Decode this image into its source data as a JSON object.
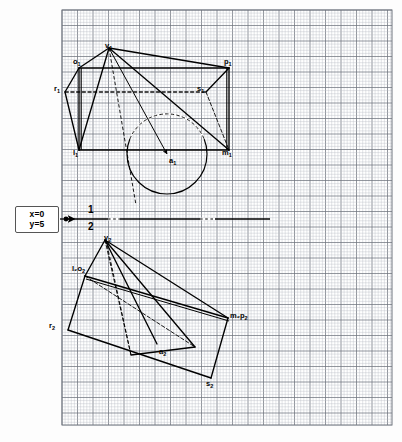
{
  "sheet": {
    "background_color": "#fdfdfd",
    "grid": {
      "x": 62,
      "y": 10,
      "width": 330,
      "height": 415,
      "minor_step": 3.1,
      "major_every": 5,
      "minor_color": "#b9bcc4",
      "major_color": "#6f747e",
      "border_color": "#6f747e"
    }
  },
  "callout": {
    "name": "coordinate-callout",
    "line1": "x=0",
    "line2": "y=5",
    "arrow_from_x": 60,
    "arrow_to_x": 74,
    "arrow_y": 219
  },
  "fold_line": {
    "label_top": "1",
    "label_bottom": "2",
    "y": 219,
    "x_start": 64,
    "x_end": 270,
    "origin_dot_x": 66,
    "label_x": 88
  },
  "labels": [
    {
      "name": "label-v1",
      "text": "v",
      "sub": "1",
      "x": 105,
      "y": 42
    },
    {
      "name": "label-o1",
      "text": "o",
      "sub": "1",
      "x": 73,
      "y": 58
    },
    {
      "name": "label-p1",
      "text": "p",
      "sub": "1",
      "x": 224,
      "y": 58
    },
    {
      "name": "label-r1",
      "text": "r",
      "sub": "1",
      "x": 54,
      "y": 85
    },
    {
      "name": "label-s1",
      "text": "s",
      "sub": "1",
      "x": 197,
      "y": 85
    },
    {
      "name": "label-l1",
      "text": "l",
      "sub": "1",
      "x": 73,
      "y": 149
    },
    {
      "name": "label-m1",
      "text": "m",
      "sub": "1",
      "x": 222,
      "y": 149
    },
    {
      "name": "label-a1",
      "text": "a",
      "sub": "1",
      "x": 169,
      "y": 157
    },
    {
      "name": "label-v2",
      "text": "v",
      "sub": "2",
      "x": 104,
      "y": 234
    },
    {
      "name": "label-l2o2",
      "text": "l₂o",
      "sub": "2",
      "x": 72,
      "y": 265
    },
    {
      "name": "label-r2",
      "text": "r",
      "sub": "2",
      "x": 49,
      "y": 322
    },
    {
      "name": "label-m2p2",
      "text": "m₂p",
      "sub": "2",
      "x": 230,
      "y": 312
    },
    {
      "name": "label-a2",
      "text": "a",
      "sub": "2",
      "x": 159,
      "y": 348
    },
    {
      "name": "label-s2",
      "text": "s",
      "sub": "2",
      "x": 206,
      "y": 380
    }
  ],
  "geometry": {
    "stroke_color": "#000000",
    "top_view": {
      "name": "top-view-cone-and-prism",
      "points": {
        "v1": [
          109,
          48
        ],
        "o1": [
          79,
          68
        ],
        "p1": [
          229,
          68
        ],
        "l1": [
          79,
          150
        ],
        "m1": [
          229,
          150
        ],
        "r1": [
          65,
          92
        ],
        "s1": [
          206,
          92
        ],
        "a1": [
          167,
          154
        ]
      },
      "circle": {
        "cx": 167,
        "cy": 154,
        "r": 40
      },
      "solid_edges": [
        [
          "o1",
          "p1"
        ],
        [
          "l1",
          "m1"
        ],
        [
          "o1",
          "l1"
        ],
        [
          "p1",
          "m1"
        ],
        [
          "o1",
          "r1"
        ],
        [
          "r1",
          "l1"
        ],
        [
          "p1",
          "s1"
        ],
        [
          "v1",
          "o1"
        ],
        [
          "v1",
          "p1"
        ],
        [
          "v1",
          "m1"
        ],
        [
          "v1",
          "l1"
        ]
      ],
      "hidden_edges": [
        [
          "s1",
          "m1"
        ],
        [
          "r1",
          "s1"
        ]
      ],
      "arrow_line": [
        "v1",
        "a1"
      ]
    },
    "front_view": {
      "name": "front-view-cone-and-prism",
      "points": {
        "v2": [
          105,
          240
        ],
        "l2o2": [
          85,
          276
        ],
        "m2p2": [
          228,
          318
        ],
        "s2": [
          211,
          378
        ],
        "r2": [
          68,
          330
        ],
        "a2": [
          157,
          344
        ],
        "b2": [
          131,
          355
        ],
        "c2": [
          195,
          347
        ]
      },
      "solid_edges": [
        [
          "l2o2",
          "m2p2"
        ],
        [
          "m2p2",
          "s2"
        ],
        [
          "s2",
          "r2"
        ],
        [
          "r2",
          "l2o2"
        ],
        [
          "v2",
          "l2o2"
        ],
        [
          "v2",
          "m2p2"
        ],
        [
          "v2",
          "c2"
        ],
        [
          "v2",
          "a2"
        ],
        [
          "b2",
          "c2"
        ]
      ],
      "hidden_edges": [
        [
          "v2",
          "b2"
        ],
        [
          "l2o2",
          "c2"
        ]
      ]
    }
  }
}
